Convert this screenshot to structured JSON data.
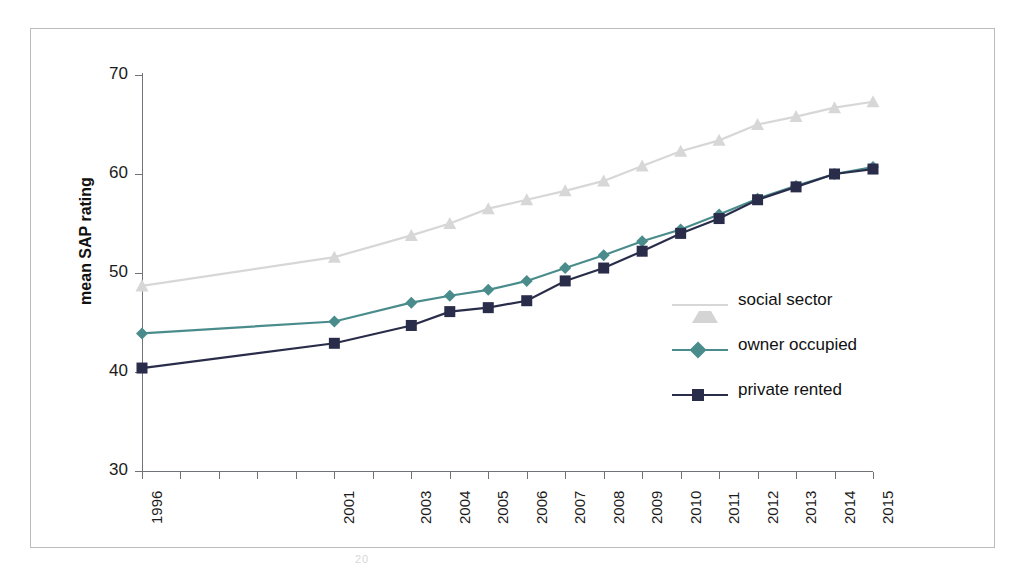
{
  "chart_data": {
    "type": "line",
    "title": "",
    "xlabel": "",
    "ylabel": "mean SAP rating",
    "ylim": [
      30,
      70
    ],
    "yticks": [
      30,
      40,
      50,
      60,
      70
    ],
    "grid": false,
    "legend_position": "inside-right",
    "x": [
      "1996",
      "2001",
      "2003",
      "2004",
      "2005",
      "2006",
      "2007",
      "2008",
      "2009",
      "2010",
      "2011",
      "2012",
      "2013",
      "2014",
      "2015"
    ],
    "x_tick_labels": [
      "1996",
      "",
      "",
      "",
      "",
      "2001",
      "",
      "2003",
      "2004",
      "2005",
      "2006",
      "2007",
      "2008",
      "2009",
      "2010",
      "2011",
      "2012",
      "2013",
      "2014",
      "2015"
    ],
    "x_tick_count": 20,
    "series": [
      {
        "name": "social sector",
        "color": "#d7d7d7",
        "marker": "triangle",
        "values": [
          48.7,
          51.6,
          53.8,
          55.0,
          56.5,
          57.4,
          58.3,
          59.3,
          60.8,
          62.3,
          63.4,
          65.0,
          65.8,
          66.7,
          67.3
        ]
      },
      {
        "name": "owner occupied",
        "color": "#4a8c8c",
        "marker": "diamond",
        "values": [
          43.9,
          45.1,
          47.0,
          47.7,
          48.3,
          49.2,
          50.5,
          51.8,
          53.2,
          54.4,
          55.9,
          57.5,
          58.8,
          60.0,
          60.7
        ]
      },
      {
        "name": "private rented",
        "color": "#2a2d4a",
        "marker": "square",
        "values": [
          40.4,
          42.9,
          44.7,
          46.1,
          46.5,
          47.2,
          49.2,
          50.5,
          52.2,
          54.0,
          55.5,
          57.4,
          58.7,
          60.0,
          60.5
        ]
      }
    ]
  },
  "axis": {
    "y_title": "mean SAP rating",
    "y_tick_labels": [
      "70",
      "60",
      "50",
      "40",
      "30"
    ]
  },
  "legend": {
    "items": [
      {
        "label": "social sector"
      },
      {
        "label": "owner occupied"
      },
      {
        "label": "private rented"
      }
    ]
  },
  "artifact": {
    "footer_mark": "20"
  }
}
